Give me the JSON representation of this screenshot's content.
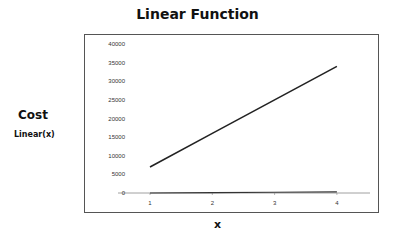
{
  "chart_data": {
    "type": "line",
    "title": "Linear Function",
    "xlabel": "x",
    "ylabel": "Cost",
    "ylabel_sub": "Linear(x)",
    "categories": [
      "1",
      "2",
      "3",
      "4"
    ],
    "series": [
      {
        "name": "Cost",
        "values": [
          7000,
          16000,
          25000,
          34000
        ],
        "color": "#222222"
      },
      {
        "name": "Linear(x)",
        "values": [
          0,
          100,
          200,
          300
        ],
        "color": "#333333"
      }
    ],
    "ylim": [
      0,
      40000
    ],
    "yticks": [
      0,
      5000,
      10000,
      15000,
      20000,
      25000,
      30000,
      35000,
      40000
    ],
    "grid": false,
    "legend": "none"
  }
}
